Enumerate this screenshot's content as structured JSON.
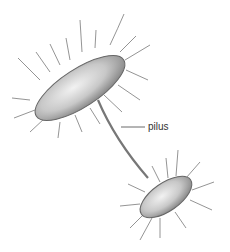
{
  "diagram": {
    "labels": [
      {
        "text": "pilus",
        "x": 148,
        "y": 121
      }
    ]
  }
}
